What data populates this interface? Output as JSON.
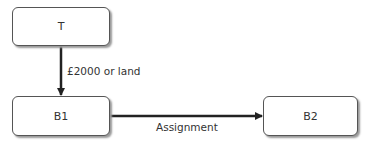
{
  "nodes": {
    "t": {
      "label": "T"
    },
    "b1": {
      "label": "B1"
    },
    "b2": {
      "label": "B2"
    }
  },
  "edges": {
    "t_to_b1": {
      "label": "£2000 or land"
    },
    "b1_to_b2": {
      "label": "Assignment"
    }
  }
}
